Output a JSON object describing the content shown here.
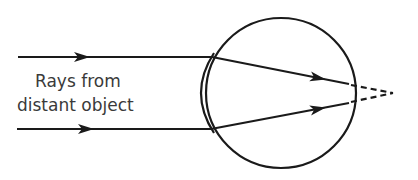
{
  "diagram": {
    "label_line1": "Rays from",
    "label_line2": "distant object",
    "elements": [
      {
        "type": "incoming-ray",
        "position": "upper",
        "direction": "right"
      },
      {
        "type": "incoming-ray",
        "position": "lower",
        "direction": "right"
      },
      {
        "type": "eyeball",
        "shape": "circle"
      },
      {
        "type": "cornea-lens",
        "shape": "bulge on left of eyeball"
      },
      {
        "type": "refracted-ray",
        "position": "upper",
        "ends_at": "retina"
      },
      {
        "type": "refracted-ray",
        "position": "lower",
        "ends_at": "retina"
      },
      {
        "type": "virtual-focus",
        "style": "dashed",
        "location": "behind retina"
      }
    ],
    "colors": {
      "stroke": "#1a1a1a",
      "text": "#3a3a3a",
      "background": "#ffffff"
    }
  }
}
